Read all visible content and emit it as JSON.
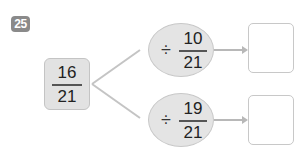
{
  "problem_number": "25",
  "source_fraction": {
    "numerator": "16",
    "denominator": "21"
  },
  "branches": [
    {
      "operator": "÷",
      "numerator": "10",
      "denominator": "21",
      "answer": ""
    },
    {
      "operator": "÷",
      "numerator": "19",
      "denominator": "21",
      "answer": ""
    }
  ],
  "colors": {
    "badge": "#8a8a8a",
    "box_fill": "#e2e2e2",
    "line": "#c4c4c4",
    "arrow": "#b8b8b8"
  }
}
